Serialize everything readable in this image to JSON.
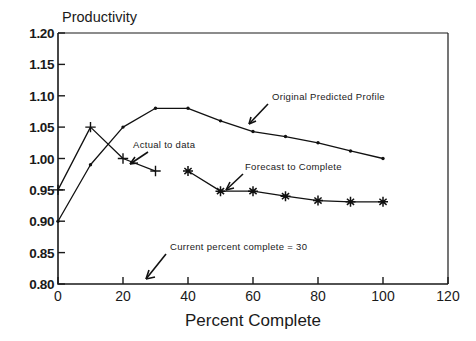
{
  "chart_data": {
    "type": "line",
    "title": "",
    "xlabel": "Percent Complete",
    "ylabel": "Productivity",
    "xlim": [
      0,
      120
    ],
    "ylim": [
      0.8,
      1.2
    ],
    "xticks": [
      "0",
      "20",
      "40",
      "60",
      "80",
      "100",
      "120"
    ],
    "xtick_values": [
      0,
      20,
      40,
      60,
      80,
      100,
      120
    ],
    "yticks": [
      "0.80",
      "0.85",
      "0.90",
      "0.95",
      "1.00",
      "1.05",
      "1.10",
      "1.15",
      "1.20"
    ],
    "ytick_values": [
      0.8,
      0.85,
      0.9,
      0.95,
      1.0,
      1.05,
      1.1,
      1.15,
      1.2
    ],
    "grid": false,
    "legend_position": "inline-annotations",
    "series": [
      {
        "name": "Original Predicted Profile",
        "marker": "dot",
        "x": [
          0,
          10,
          20,
          30,
          40,
          50,
          60,
          70,
          80,
          90,
          100
        ],
        "y": [
          0.9,
          0.99,
          1.05,
          1.08,
          1.08,
          1.06,
          1.043,
          1.035,
          1.025,
          1.012,
          1.0
        ]
      },
      {
        "name": "Actual to date",
        "marker": "plus",
        "x": [
          0,
          10,
          20,
          30
        ],
        "y": [
          0.95,
          1.05,
          1.0,
          0.98
        ]
      },
      {
        "name": "Forecast to Complete",
        "marker": "star",
        "x": [
          40,
          50,
          60,
          70,
          80,
          90,
          100
        ],
        "y": [
          0.98,
          0.948,
          0.948,
          0.94,
          0.933,
          0.931,
          0.931
        ]
      }
    ],
    "annotations": [
      {
        "text": "Original Predicted Profile",
        "target_x": 55,
        "target_y": 1.06
      },
      {
        "text": "Actual to data",
        "target_x": 21,
        "target_y": 1.0
      },
      {
        "text": "Forecast to Complete",
        "target_x": 50,
        "target_y": 0.948
      },
      {
        "text": "Current percent complete = 30",
        "target_x": 30,
        "target_y": 0.8
      }
    ]
  },
  "axis": {
    "y_title": "Productivity",
    "x_title": "Percent Complete"
  },
  "annotations": {
    "original_predicted_profile": "Original Predicted Profile",
    "actual_to_data": "Actual to data",
    "forecast_to_complete": "Forecast to Complete",
    "current_percent_complete": "Current percent complete = 30"
  },
  "ytick_labels": {
    "t0": "0.80",
    "t1": "0.85",
    "t2": "0.90",
    "t3": "0.95",
    "t4": "1.00",
    "t5": "1.05",
    "t6": "1.10",
    "t7": "1.15",
    "t8": "1.20"
  },
  "xtick_labels": {
    "t0": "0",
    "t1": "20",
    "t2": "40",
    "t3": "60",
    "t4": "80",
    "t5": "100",
    "t6": "120"
  },
  "colors": {
    "ink": "#1a1a1a",
    "line": "#111111",
    "background": "#ffffff"
  }
}
